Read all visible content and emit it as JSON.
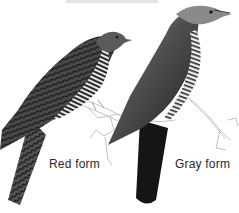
{
  "illustration": {
    "subject": "Two cuckoo color morphs",
    "labels": {
      "red_form": "Red form",
      "gray_form": "Gray form"
    },
    "colors": {
      "background": "#ffffff",
      "red_form_body": "#3a3a3a",
      "red_form_bars": "#1c1c1c",
      "gray_form_body": "#4a4a4a",
      "gray_form_head": "#8a8a8a",
      "gray_form_tail": "#141414",
      "branch": "#bdbdbd",
      "label_text": "#2a2a2a"
    }
  }
}
